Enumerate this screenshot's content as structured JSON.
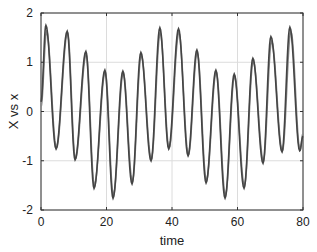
{
  "chart_data": {
    "type": "line",
    "title": "",
    "xlabel": "time",
    "ylabel": "X vs x",
    "xlim": [
      0,
      80
    ],
    "ylim": [
      -2,
      2
    ],
    "xticks": [
      0,
      20,
      40,
      60,
      80
    ],
    "yticks": [
      -2,
      -1,
      0,
      1,
      2
    ],
    "xtick_labels": [
      "0",
      "20",
      "40",
      "60",
      "80"
    ],
    "ytick_labels": [
      "-2",
      "-1",
      "0",
      "1",
      "2"
    ],
    "grid": true,
    "legend": null,
    "extrema_description": "Oscillating signal with ~5.8 time-unit period and slowly modulated amplitude; two nearly overlapping series (dark and gray).",
    "series": [
      {
        "name": "X",
        "color": "#444444",
        "x": [
          0,
          1.5,
          4.6,
          8.0,
          10.4,
          13.7,
          16.2,
          19.5,
          22.0,
          25.0,
          27.8,
          30.5,
          33.6,
          36.3,
          39.0,
          42.0,
          44.9,
          47.6,
          50.4,
          53.4,
          56.2,
          59.0,
          62.0,
          64.7,
          67.8,
          70.2,
          73.6,
          76.0,
          79.0,
          80
        ],
        "y": [
          0.2,
          1.75,
          -0.76,
          1.63,
          -0.98,
          1.22,
          -1.56,
          0.84,
          -1.76,
          0.82,
          -1.47,
          1.2,
          -1.0,
          1.7,
          -0.76,
          1.68,
          -0.9,
          1.25,
          -1.45,
          0.84,
          -1.76,
          0.76,
          -1.56,
          1.08,
          -1.05,
          1.52,
          -0.82,
          1.71,
          -0.8,
          -0.5
        ]
      },
      {
        "name": "x",
        "color": "#8a8a8a",
        "x": [
          0,
          1.7,
          4.7,
          8.1,
          10.5,
          13.8,
          16.3,
          19.6,
          22.1,
          25.1,
          27.9,
          30.6,
          33.7,
          36.4,
          39.1,
          42.1,
          45.0,
          47.7,
          50.5,
          53.5,
          56.3,
          59.1,
          62.1,
          64.8,
          67.9,
          70.4,
          73.7,
          76.3,
          79.1,
          80
        ],
        "y": [
          0.1,
          1.62,
          -0.74,
          1.6,
          -0.96,
          1.16,
          -1.5,
          0.8,
          -1.7,
          0.78,
          -1.42,
          1.14,
          -0.97,
          1.6,
          -0.74,
          1.6,
          -0.88,
          1.2,
          -1.4,
          0.8,
          -1.7,
          0.72,
          -1.5,
          1.02,
          -1.0,
          1.42,
          -0.8,
          1.62,
          -0.78,
          -0.45
        ]
      }
    ]
  }
}
